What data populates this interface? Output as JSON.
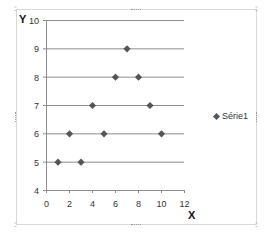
{
  "chart_data": {
    "type": "scatter",
    "title": "",
    "xlabel": "X",
    "ylabel": "Y",
    "xlim": [
      0,
      12
    ],
    "ylim": [
      4,
      10
    ],
    "x_ticks": [
      "0",
      "2",
      "4",
      "6",
      "8",
      "10",
      "12"
    ],
    "y_ticks": [
      "4",
      "5",
      "6",
      "7",
      "8",
      "9",
      "10"
    ],
    "grid": "horizontal major gridlines",
    "legend_position": "right",
    "series": [
      {
        "name": "Série1",
        "marker": "diamond",
        "color": "#555555",
        "points": [
          {
            "x": 1,
            "y": 5
          },
          {
            "x": 3,
            "y": 5
          },
          {
            "x": 2,
            "y": 6
          },
          {
            "x": 5,
            "y": 6
          },
          {
            "x": 10,
            "y": 6
          },
          {
            "x": 4,
            "y": 7
          },
          {
            "x": 9,
            "y": 7
          },
          {
            "x": 6,
            "y": 8
          },
          {
            "x": 8,
            "y": 8
          },
          {
            "x": 7,
            "y": 9
          }
        ]
      }
    ]
  },
  "labels": {
    "y_axis": "Y",
    "x_axis": "X",
    "legend": "Série1"
  },
  "colors": {
    "gridline": "#8c8c8c",
    "axis": "#8c8c8c",
    "marker": "#555555",
    "frame": "#d9d9d9"
  }
}
